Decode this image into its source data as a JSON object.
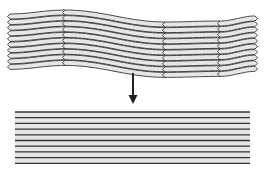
{
  "diagram": {
    "top_stack": {
      "label": "",
      "layer_count": 10,
      "fill_color": "#e6e6e6",
      "stroke_color": "#333333",
      "left_x": 10,
      "right_x": 255,
      "seam_x": [
        65,
        165,
        220
      ],
      "top_y_at": {
        "10": 14,
        "65": 10,
        "165": 22,
        "220": 21,
        "255": 16
      },
      "layer_spacing": 5.6
    },
    "arrow": {
      "x": 133,
      "y_start": 73,
      "y_end": 104,
      "color": "#222222",
      "icon": "down-arrow-icon"
    },
    "bottom_stack": {
      "label": "",
      "line_count": 10,
      "left_x": 15,
      "right_x": 250,
      "top_y": 112,
      "spacing": 5.7,
      "line_color": "#333333",
      "fill_color": "#e6e6e6"
    }
  }
}
